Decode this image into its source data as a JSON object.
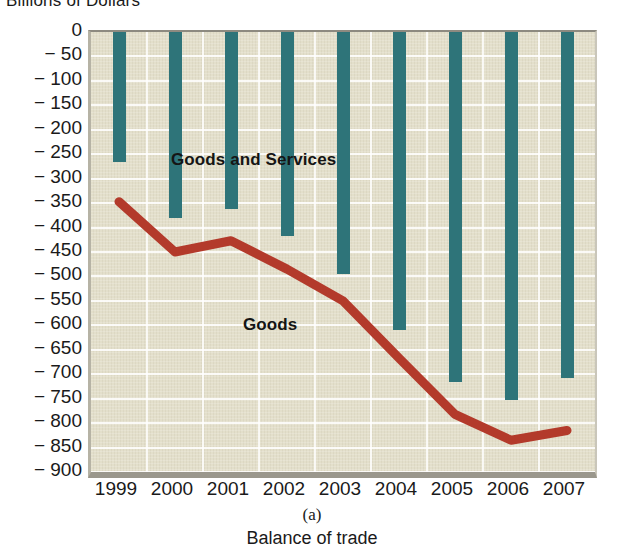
{
  "chart_data": {
    "type": "bar",
    "title": "Billions of Dollars",
    "xlabel": "",
    "ylabel": "Billions of Dollars",
    "categories": [
      "1999",
      "2000",
      "2001",
      "2002",
      "2003",
      "2004",
      "2005",
      "2006",
      "2007"
    ],
    "ylim": [
      -900,
      0
    ],
    "ytick_step": 50,
    "yticks": [
      "0",
      "− 50",
      "− 100",
      "− 150",
      "− 200",
      "− 250",
      "− 300",
      "− 350",
      "− 400",
      "− 450",
      "− 500",
      "− 550",
      "− 600",
      "− 650",
      "− 700",
      "− 750",
      "− 800",
      "− 850",
      "− 900"
    ],
    "ytick_values": [
      0,
      -50,
      -100,
      -150,
      -200,
      -250,
      -300,
      -350,
      -400,
      -450,
      -500,
      -550,
      -600,
      -650,
      -700,
      -750,
      -800,
      -850,
      -900
    ],
    "grid": true,
    "legend_position": "inline-annotations",
    "series": [
      {
        "name": "Goods and Services",
        "type": "bar",
        "color": "#2e7479",
        "values": [
          -265,
          -380,
          -362,
          -418,
          -495,
          -610,
          -715,
          -753,
          -708
        ]
      },
      {
        "name": "Goods",
        "type": "line",
        "color": "#b33a2b",
        "values": [
          -347,
          -450,
          -427,
          -485,
          -550,
          -667,
          -782,
          -835,
          -815
        ]
      }
    ],
    "annotations": [
      {
        "text": "Goods and Services",
        "x": "2001",
        "y": -240
      },
      {
        "text": "Goods",
        "x": "2002",
        "y": -590
      }
    ]
  },
  "caption": {
    "letter": "(a)",
    "text": "Balance of trade"
  },
  "colors": {
    "bar": "#2e7479",
    "line": "#b33a2b",
    "plot_background": "#e3dfcb",
    "gridline": "#ffffff",
    "text": "#1a1a1a"
  }
}
